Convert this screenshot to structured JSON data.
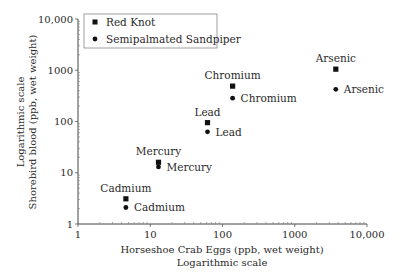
{
  "chart_data": {
    "type": "scatter",
    "title": "",
    "xlabel": "Horseshoe Crab Eggs (ppb, wet weight)",
    "xlabel_sub": "Logarithmic scale",
    "ylabel": "Shorebird blood (ppb, wet weight)",
    "ylabel_sub": "Logarithmic scale",
    "xscale": "log",
    "yscale": "log",
    "xlim": [
      1,
      10000
    ],
    "ylim": [
      1,
      10000
    ],
    "x_ticks": [
      "1",
      "10",
      "100",
      "1000",
      "10,000"
    ],
    "y_ticks": [
      "1",
      "10",
      "100",
      "1000",
      "10,000"
    ],
    "grid": false,
    "legend_position": "upper left",
    "categories": [
      "Cadmium",
      "Mercury",
      "Lead",
      "Chromium",
      "Arsenic"
    ],
    "x": [
      4.6,
      13,
      62,
      138,
      3700
    ],
    "series": [
      {
        "name": "Red Knot",
        "marker": "square",
        "values": [
          3.1,
          16,
          95,
          490,
          1050
        ]
      },
      {
        "name": "Semipalmated Sandpiper",
        "marker": "circle",
        "values": [
          2.1,
          13,
          63,
          285,
          425
        ]
      }
    ]
  },
  "legend": {
    "items": [
      {
        "label": "Red Knot",
        "marker": "square"
      },
      {
        "label": "Semipalmated Sandpiper",
        "marker": "circle"
      }
    ]
  },
  "colors": {
    "marker": "#111111",
    "text": "#2a2a2a",
    "axis": "#444444"
  }
}
